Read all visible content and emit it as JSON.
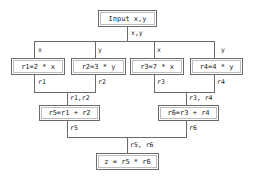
{
  "diagram": {
    "nodes": {
      "input": "Input x,y",
      "r1": "r1=2 * x",
      "r2": "r2=3 * y",
      "r3": "r3=7 * x",
      "r4": "r4=4 * y",
      "r5": "r5=r1 + r2",
      "r6": "r6=r3 + r4",
      "z": "z = r5 * r6"
    },
    "edge_labels": {
      "input_out": "x,y",
      "to_r1": "x",
      "to_r2": "y",
      "to_r3": "x",
      "to_r4": "y",
      "r1_out": "r1",
      "r2_out": "r2",
      "r3_out": "r3",
      "r4_out": "r4",
      "to_r5": "r1,r2",
      "to_r6": "r3, r4",
      "r5_out": "r5",
      "r6_out": "r6",
      "to_z": "r5, r6"
    },
    "colors": {
      "line": "#6a6a6a",
      "background": "#ffffff",
      "text": "#222222"
    }
  }
}
